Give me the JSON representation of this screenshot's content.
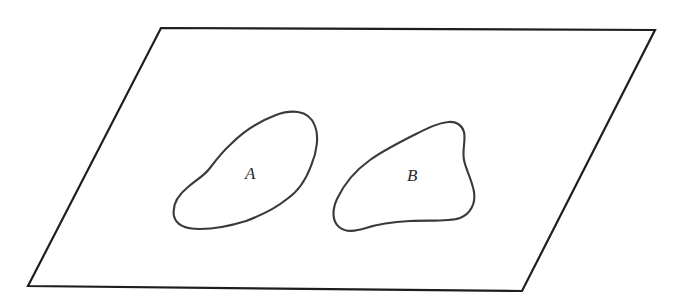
{
  "diagram": {
    "type": "venn-style-plane",
    "colors": {
      "plane_stroke": "#1e1e1e",
      "region_stroke": "#3a3a3a",
      "label": "#2a2a2a",
      "background": "#ffffff"
    },
    "plane": {
      "shape": "parallelogram",
      "corners": {
        "top_left": [
          161,
          28
        ],
        "top_right": [
          655,
          30
        ],
        "bottom_right": [
          522,
          291
        ],
        "bottom_left": [
          28,
          286
        ]
      }
    },
    "regions": [
      {
        "label": "A",
        "label_position": [
          253,
          179
        ]
      },
      {
        "label": "B",
        "label_position": [
          415,
          181
        ]
      }
    ],
    "relationship": "disjoint"
  }
}
